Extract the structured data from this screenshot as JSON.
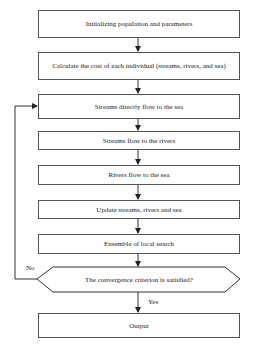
{
  "diagram": {
    "type": "flowchart",
    "steps": [
      {
        "id": "init",
        "label": "Initializing population and parameters"
      },
      {
        "id": "cost",
        "label": "Calculate the cost of each individual (streams, rivers, and sea)"
      },
      {
        "id": "streams_sea",
        "label": "Streams directly flow to the sea"
      },
      {
        "id": "streams_rivers",
        "label": "Streams flow to the rivers"
      },
      {
        "id": "rivers_sea",
        "label": "Rivers flow to the sea"
      },
      {
        "id": "update",
        "label": "Update streams, rivers and sea"
      },
      {
        "id": "local_search",
        "label": "Ensemble of local search"
      },
      {
        "id": "decision",
        "label": "The convergence criterion is satisfied?"
      },
      {
        "id": "output",
        "label": "Output"
      }
    ],
    "edges": {
      "yes_label": "Yes",
      "no_label": "No"
    },
    "colors": {
      "line": "#333333",
      "background": "#ffffff"
    }
  }
}
